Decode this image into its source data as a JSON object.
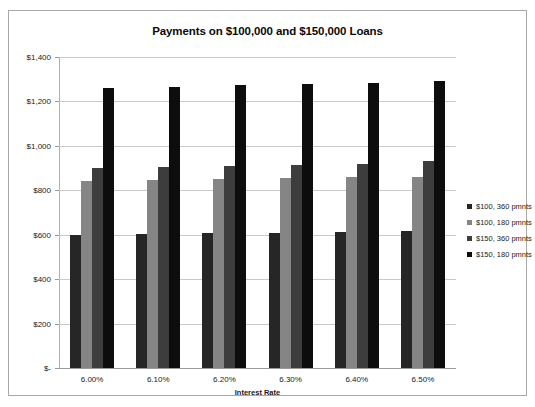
{
  "chart_data": {
    "type": "bar",
    "title": "Payments on $100,000 and $150,000 Loans",
    "xlabel": "Interest Rate",
    "ylabel": "",
    "categories": [
      "6.00%",
      "6.10%",
      "6.20%",
      "6.30%",
      "6.40%",
      "6.50%"
    ],
    "ylim": [
      0,
      1400
    ],
    "ytick_values": [
      0,
      200,
      400,
      600,
      800,
      1000,
      1200,
      1400
    ],
    "ytick_labels": [
      "$-",
      "$200",
      "$400",
      "$600",
      "$800",
      "$1,000",
      "$1,200",
      "$1,400"
    ],
    "grid": true,
    "legend_position": "right",
    "series": [
      {
        "name": "$100, 360 pmnts",
        "color": "#262626",
        "values": [
          600,
          603,
          607,
          610,
          613,
          617
        ]
      },
      {
        "name": "$100, 180 pmnts",
        "color": "#858585",
        "values": [
          844,
          848,
          851,
          855,
          859,
          862
        ]
      },
      {
        "name": "$150, 360 pmnts",
        "color": "#3d3d3d",
        "values": [
          899,
          905,
          910,
          915,
          920,
          933
        ]
      },
      {
        "name": "$150, 180 pmnts",
        "color": "#0d0d0d",
        "values": [
          1262,
          1267,
          1272,
          1278,
          1285,
          1290
        ]
      }
    ]
  }
}
